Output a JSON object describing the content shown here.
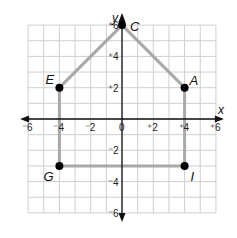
{
  "diagram": {
    "type": "coordinate-plane",
    "axes": {
      "x_label": "x",
      "y_label": "y",
      "range": [
        -6,
        6
      ],
      "x_ticks": [
        {
          "value": -6,
          "label": "⁻6"
        },
        {
          "value": -4,
          "label": "⁻4"
        },
        {
          "value": -2,
          "label": "⁻2"
        },
        {
          "value": 0,
          "label": "0"
        },
        {
          "value": 2,
          "label": "⁺2"
        },
        {
          "value": 4,
          "label": "⁺4"
        },
        {
          "value": 6,
          "label": "⁺6"
        }
      ],
      "y_ticks": [
        {
          "value": 6,
          "label": "⁺6"
        },
        {
          "value": 4,
          "label": "⁺4"
        },
        {
          "value": 2,
          "label": "⁺2"
        },
        {
          "value": -2,
          "label": "⁻2"
        },
        {
          "value": -4,
          "label": "⁻4"
        },
        {
          "value": -6,
          "label": "⁻6"
        }
      ],
      "grid": true
    },
    "points": [
      {
        "name": "A",
        "x": 4,
        "y": 2
      },
      {
        "name": "C",
        "x": 0,
        "y": 6
      },
      {
        "name": "E",
        "x": -4,
        "y": 2
      },
      {
        "name": "G",
        "x": -4,
        "y": -3
      },
      {
        "name": "I",
        "x": 4,
        "y": -3
      }
    ],
    "polygon_order": [
      "C",
      "A",
      "I",
      "G",
      "E"
    ],
    "colors": {
      "grid": "#cfcfcf",
      "axis": "#111111",
      "edge": "#a8a8a8",
      "point": "#000000"
    }
  }
}
